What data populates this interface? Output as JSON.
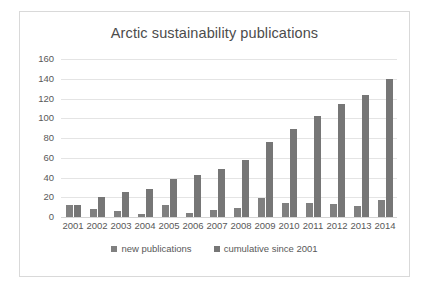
{
  "chart_data": {
    "type": "bar",
    "title": "Arctic sustainability publications",
    "xlabel": "",
    "ylabel": "",
    "categories": [
      "2001",
      "2002",
      "2003",
      "2004",
      "2005",
      "2006",
      "2007",
      "2008",
      "2009",
      "2010",
      "2011",
      "2012",
      "2013",
      "2014"
    ],
    "series": [
      {
        "name": "new publications",
        "color": "#808080",
        "values": [
          12,
          8,
          6,
          3,
          12,
          4,
          7,
          9,
          19,
          14,
          14,
          13,
          11,
          17
        ]
      },
      {
        "name": "cumulative since 2001",
        "color": "#767676",
        "values": [
          12,
          20,
          25,
          28,
          39,
          43,
          49,
          58,
          76,
          89,
          102,
          114,
          124,
          140
        ]
      }
    ],
    "ylim": [
      0,
      160
    ],
    "ytick_labels": [
      "160",
      "140",
      "120",
      "100",
      "80",
      "60",
      "40",
      "20",
      "0"
    ],
    "ytick_values": [
      160,
      140,
      120,
      100,
      80,
      60,
      40,
      20,
      0
    ],
    "grid": true,
    "legend_position": "bottom"
  },
  "legend": {
    "items": [
      {
        "label": "new publications"
      },
      {
        "label": "cumulative since 2001"
      }
    ]
  },
  "colors": {
    "bar_new": "#808080",
    "bar_cumulative": "#767676",
    "gridline": "#e4e4e4",
    "text": "#595959",
    "title_text": "#4c4c4c",
    "frame_border": "#d9d9d9",
    "background": "#ffffff"
  }
}
